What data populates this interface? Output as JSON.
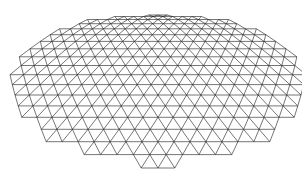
{
  "figure": {
    "background": "#ffffff",
    "stroke": "#1a1a1a",
    "center_x": 158,
    "center_y": 100,
    "radius_x": 148,
    "radius_y": 78,
    "near_y": 168,
    "far_y": 15,
    "rows": 18,
    "cols": 22
  }
}
